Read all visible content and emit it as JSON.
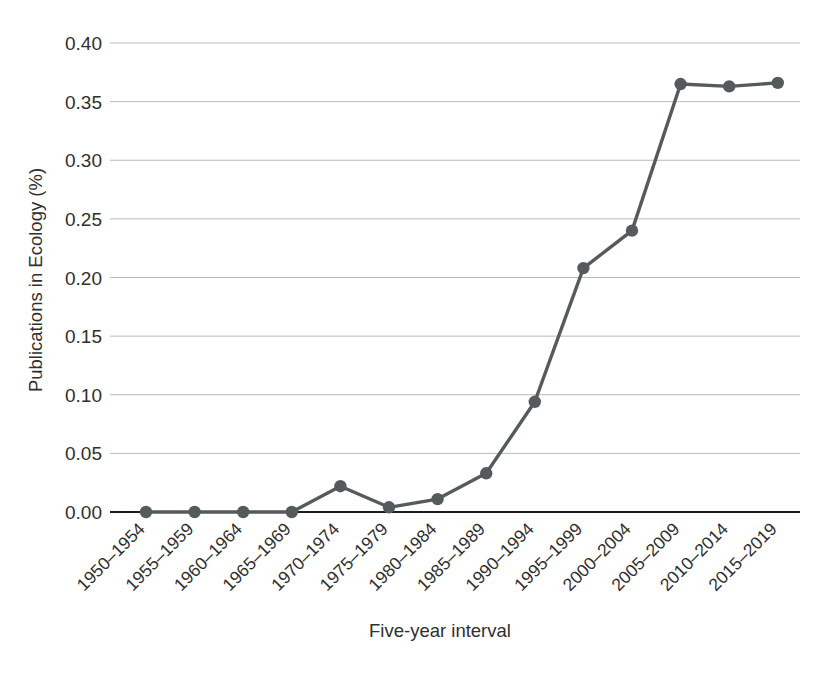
{
  "chart_data": {
    "type": "line",
    "title": "",
    "subtitle": "",
    "xlabel": "Five-year interval",
    "ylabel": "Publications in Ecology (%)",
    "categories": [
      "1950–1954",
      "1955–1959",
      "1960–1964",
      "1965–1969",
      "1970–1974",
      "1975–1979",
      "1980–1984",
      "1985–1989",
      "1990–1994",
      "1995–1999",
      "2000–2004",
      "2005–2009",
      "2010–2014",
      "2015–2019"
    ],
    "values": [
      0.0,
      0.0,
      0.0,
      0.0,
      0.022,
      0.004,
      0.011,
      0.033,
      0.094,
      0.208,
      0.24,
      0.365,
      0.363,
      0.366
    ],
    "series": [
      {
        "name": "Publications in Ecology (%)",
        "values": [
          0.0,
          0.0,
          0.0,
          0.0,
          0.022,
          0.004,
          0.011,
          0.033,
          0.094,
          0.208,
          0.24,
          0.365,
          0.363,
          0.366
        ],
        "color": "#555a5c",
        "marker": "circle"
      }
    ],
    "ylim": [
      0.0,
      0.4
    ],
    "yticks": [
      0.0,
      0.05,
      0.1,
      0.15,
      0.2,
      0.25,
      0.3,
      0.35,
      0.4
    ],
    "ytick_labels": [
      "0.00",
      "0.05",
      "0.10",
      "0.15",
      "0.20",
      "0.25",
      "0.30",
      "0.35",
      "0.40"
    ],
    "grid": true,
    "grid_axis": "y",
    "legend": false,
    "legend_position": "none",
    "xtick_rotation": -45,
    "background_color": "#ffffff",
    "gridline_color": "#b9b9b9",
    "axis_color": "#1d1d1d",
    "text_color": "#2f2f2f"
  },
  "layout": {
    "plot_left": 120,
    "plot_right": 800,
    "plot_top": 43,
    "plot_bottom": 512,
    "first_point_x": 146,
    "point_spacing": 48.6,
    "marker_radius": 6.2,
    "canvas_width": 840,
    "canvas_height": 676
  }
}
